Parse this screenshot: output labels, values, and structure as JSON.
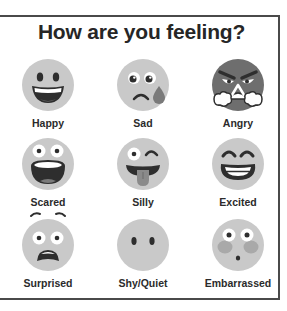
{
  "title": "How are you feeling?",
  "colors": {
    "face": "#c9c9c9",
    "feature": "#2e2e2e",
    "angry_face": "#6e6e6e",
    "border": "#4a4a4a",
    "tear": "#7a7a7a",
    "tongue": "#8a8a8a",
    "blush": "#a9a9a9"
  },
  "emotions": [
    {
      "label": "Happy",
      "icon": "happy-face-icon"
    },
    {
      "label": "Sad",
      "icon": "sad-face-icon"
    },
    {
      "label": "Angry",
      "icon": "angry-face-icon"
    },
    {
      "label": "Scared",
      "icon": "scared-face-icon"
    },
    {
      "label": "Silly",
      "icon": "silly-face-icon"
    },
    {
      "label": "Excited",
      "icon": "excited-face-icon"
    },
    {
      "label": "Surprised",
      "icon": "surprised-face-icon"
    },
    {
      "label": "Shy/Quiet",
      "icon": "shy-face-icon"
    },
    {
      "label": "Embarrassed",
      "icon": "embarrassed-face-icon"
    }
  ]
}
